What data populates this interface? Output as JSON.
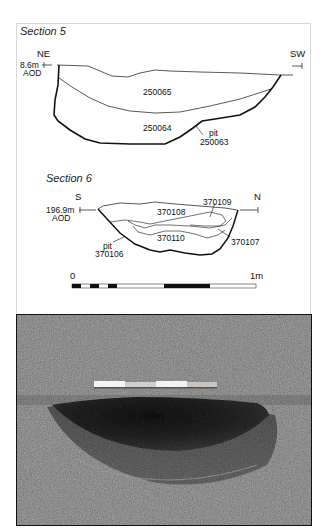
{
  "figure": {
    "section5": {
      "title": "Section 5",
      "left_dir": "NE",
      "right_dir": "SW",
      "datum_level": "8.6m",
      "datum_unit": "AOD",
      "layers": [
        {
          "id": "250065"
        },
        {
          "id": "250064"
        }
      ],
      "cut_label": "pit",
      "cut_id": "250063"
    },
    "section6": {
      "title": "Section 6",
      "left_dir": "S",
      "right_dir": "N",
      "datum_level": "196.9m",
      "datum_unit": "AOD",
      "layers": [
        {
          "id": "370108"
        },
        {
          "id": "370109"
        },
        {
          "id": "370110"
        },
        {
          "id": "370107"
        }
      ],
      "cut_label": "pit",
      "cut_id": "370106"
    },
    "scale_bar": {
      "start_label": "0",
      "end_label": "1m"
    },
    "photo": {
      "description": "Photograph of excavated pit with scale rod"
    },
    "colors": {
      "line": "#111111",
      "panel_border": "#d8d8d8",
      "soil_light": "#9a9a9a",
      "soil_dark": "#1e1e1e"
    }
  }
}
